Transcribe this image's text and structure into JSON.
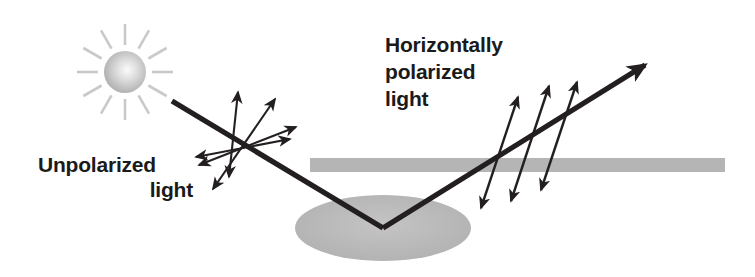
{
  "figure": {
    "background_color": "#ffffff",
    "width": 755,
    "height": 277
  },
  "labels": {
    "left": {
      "name": "unpolarized-light-label",
      "line1": "Unpolarized",
      "line2": "light",
      "x": 38,
      "y": 164,
      "color": "#1a1a1a"
    },
    "right": {
      "name": "horizontally-polarized-light-label",
      "line1": "Horizontally",
      "line2": "polarized",
      "line3": "light",
      "x": 385,
      "y": 46,
      "color": "#1a1a1a"
    }
  },
  "sun": {
    "name": "sun-icon",
    "center_x": 125,
    "center_y": 72,
    "body_radius": 21,
    "body_color": "#b8b8b8",
    "highlight_color": "#f2f2f2",
    "ray_color": "#c9c9c9",
    "ray_count": 12,
    "ray_inner_radius": 27,
    "ray_outer_radius": 48
  },
  "surface": {
    "name": "reflective-surface-bar",
    "color": "#b5b5b5",
    "x": 310,
    "y": 158,
    "width": 415,
    "height": 14
  },
  "puddle": {
    "name": "reflecting-puddle",
    "color": "#b8b8b8",
    "center_x": 383,
    "center_y": 228,
    "radius_x": 88,
    "radius_y": 33
  },
  "rays": {
    "incident": {
      "name": "incident-ray",
      "from_x": 172,
      "from_y": 101,
      "to_x": 383,
      "to_y": 228,
      "color": "#231f20",
      "arrowhead": false
    },
    "reflected": {
      "name": "reflected-ray",
      "from_x": 383,
      "from_y": 228,
      "to_x": 652,
      "to_y": 61,
      "color": "#231f20",
      "arrowhead": true
    }
  },
  "unpolarized_vibrations": {
    "name": "unpolarized-vibration-star",
    "center_x": 246,
    "center_y": 148,
    "description": "Double-headed arrows radiating in all directions showing unpolarized light",
    "arrow_count": 4,
    "angles_deg": [
      74,
      40,
      5,
      -58
    ],
    "lengths": [
      60,
      56,
      56,
      55
    ],
    "color": "#231f20"
  },
  "polarized_vibrations": {
    "name": "polarized-vibration-arrows",
    "description": "Three parallel double-headed arrows perpendicular to the reflected ray showing horizontally polarized light",
    "arrow_count": 3,
    "angle_deg": 72,
    "color": "#231f20",
    "arrows": [
      {
        "cx": 499,
        "cy": 152,
        "length": 118
      },
      {
        "cx": 529,
        "cy": 143,
        "length": 130
      },
      {
        "cx": 558,
        "cy": 133,
        "length": 122
      }
    ]
  }
}
